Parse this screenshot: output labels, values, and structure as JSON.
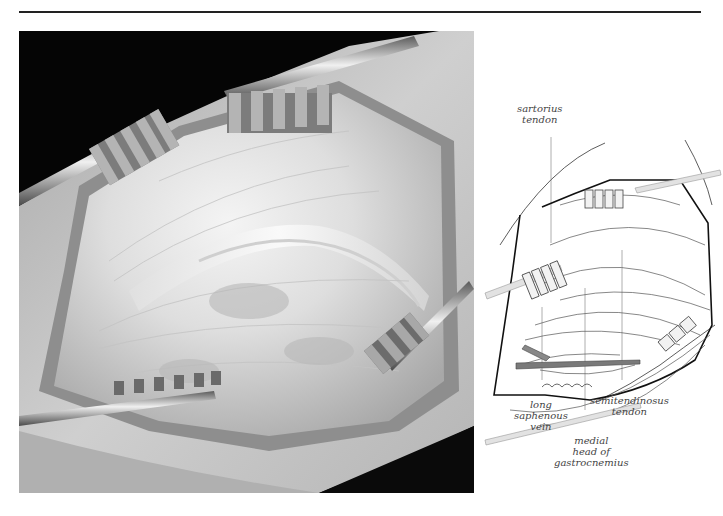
{
  "figure": {
    "photo": {
      "description": "Intraoperative photograph of exposed posteromedial knee with four toothed retractors",
      "palette": {
        "background": "#050505",
        "skin": "#c8c8c8",
        "tissue": "#dcdcdc",
        "tendon": "#f2f2f2",
        "retractor": "#9a9a9a"
      }
    },
    "diagram": {
      "labels": [
        {
          "id": "sartorius",
          "lines": [
            "sartorius",
            "tendon"
          ]
        },
        {
          "id": "long-saphenous-vein",
          "lines": [
            "long",
            "saphenous",
            "vein"
          ]
        },
        {
          "id": "semitendinosus",
          "lines": [
            "semitendinosus",
            "tendon"
          ]
        },
        {
          "id": "medial-head-gastrocnemius",
          "lines": [
            "medial",
            "head of",
            "gastrocnemius"
          ]
        }
      ],
      "colors": {
        "line": "#333333",
        "vein": "#7a7a7a",
        "leader": "#999999",
        "retractor_fill": "#e8e8e8"
      }
    }
  }
}
